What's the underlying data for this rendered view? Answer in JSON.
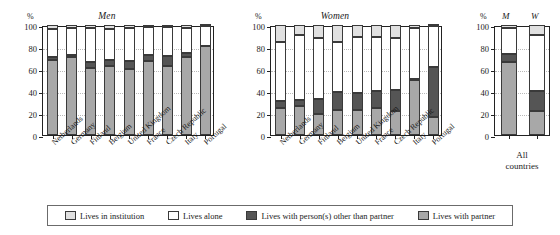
{
  "figure": {
    "axis_unit": "%",
    "panels": [
      {
        "key": "men",
        "title": "Men"
      },
      {
        "key": "women",
        "title": "Women"
      },
      {
        "key": "all",
        "title": ""
      }
    ]
  },
  "yaxis": {
    "ticks": [
      "0",
      "20",
      "40",
      "60",
      "80",
      "100"
    ],
    "min": 0,
    "max": 100,
    "unit": "%"
  },
  "legend": {
    "items": [
      {
        "key": "institution",
        "label": "Lives in institution",
        "color": "#e0e0e0"
      },
      {
        "key": "alone",
        "label": "Lives alone",
        "color": "#ffffff"
      },
      {
        "key": "other",
        "label": "Lives with person(s) other than partner",
        "color": "#555555"
      },
      {
        "key": "partner",
        "label": "Lives with partner",
        "color": "#a8a8a8"
      }
    ]
  },
  "all_countries": {
    "group_label_line1": "All",
    "group_label_line2": "countries",
    "men_header": "M",
    "women_header": "W"
  },
  "chart_data": {
    "type": "bar",
    "xlabel": "",
    "ylabel": "%",
    "ylim": [
      0,
      100
    ],
    "grid": true,
    "stacked": true,
    "stack_order": [
      "partner",
      "other",
      "alone",
      "institution"
    ],
    "legend_position": "bottom",
    "series": [
      {
        "name": "Lives with partner",
        "key": "partner",
        "color": "#a8a8a8"
      },
      {
        "name": "Lives with person(s) other than partner",
        "key": "other",
        "color": "#555555"
      },
      {
        "name": "Lives alone",
        "key": "alone",
        "color": "#ffffff"
      },
      {
        "name": "Lives in institution",
        "key": "institution",
        "color": "#e0e0e0"
      }
    ],
    "panels": [
      {
        "name": "Men",
        "categories": [
          "Netherlands",
          "Germany",
          "Finland",
          "Belgium",
          "United Kingdom",
          "France",
          "Czech Republic",
          "Italy",
          "Portugal"
        ],
        "values": {
          "partner": [
            68,
            71,
            61,
            63,
            60,
            67,
            63,
            71,
            81
          ],
          "other": [
            3,
            2,
            5,
            5,
            7,
            6,
            9,
            4,
            0
          ],
          "alone": [
            25,
            24,
            31,
            28,
            30,
            25,
            26,
            22,
            18
          ],
          "institution": [
            4,
            3,
            3,
            4,
            3,
            2,
            2,
            3,
            1
          ]
        },
        "cumulative": {
          "partner": [
            68,
            71,
            61,
            63,
            60,
            67,
            63,
            71,
            81
          ],
          "other": [
            71,
            73,
            66,
            68,
            67,
            73,
            72,
            75,
            81
          ],
          "alone": [
            96,
            97,
            97,
            96,
            97,
            98,
            98,
            97,
            99
          ]
        }
      },
      {
        "name": "Women",
        "categories": [
          "Netherlands",
          "Germany",
          "Finland",
          "Belgium",
          "United Kingdom",
          "France",
          "Czech Republic",
          "Italy",
          "Portugal"
        ],
        "values": {
          "partner": [
            25,
            26,
            19,
            23,
            23,
            25,
            22,
            50,
            16
          ],
          "other": [
            6,
            6,
            14,
            16,
            15,
            15,
            19,
            1,
            46
          ],
          "alone": [
            54,
            59,
            55,
            46,
            51,
            49,
            47,
            46,
            37
          ],
          "institution": [
            15,
            9,
            12,
            15,
            11,
            11,
            12,
            3,
            1
          ]
        },
        "cumulative": {
          "partner": [
            25,
            26,
            19,
            23,
            23,
            25,
            22,
            50,
            16
          ],
          "other": [
            31,
            32,
            33,
            39,
            38,
            40,
            41,
            51,
            62
          ],
          "alone": [
            85,
            91,
            88,
            85,
            89,
            89,
            88,
            97,
            99
          ]
        }
      },
      {
        "name": "All countries",
        "categories": [
          "M",
          "W"
        ],
        "values": {
          "partner": [
            66,
            22
          ],
          "other": [
            8,
            18
          ],
          "alone": [
            23,
            51
          ],
          "institution": [
            3,
            9
          ]
        },
        "cumulative": {
          "partner": [
            66,
            22
          ],
          "other": [
            74,
            40
          ],
          "alone": [
            97,
            91
          ]
        }
      }
    ]
  }
}
